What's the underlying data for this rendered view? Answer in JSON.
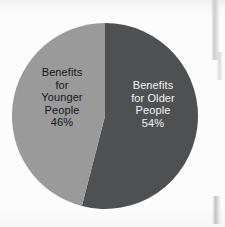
{
  "chart_data": {
    "type": "pie",
    "title": "",
    "subtitle": "",
    "xlabel": "",
    "ylabel": "",
    "legend_position": "none",
    "grid": false,
    "labels_inside_slices": true,
    "start_angle_deg": 0,
    "direction": "clockwise",
    "categories": [
      "Benefits for Older People",
      "Benefits for Younger People"
    ],
    "values": [
      54,
      46
    ],
    "units": "%",
    "slices": [
      {
        "name": "Benefits for Older People",
        "value": 54,
        "value_label": "54%",
        "label_lines": [
          "Benefits",
          "for Older",
          "People",
          "54%"
        ],
        "label_text": "Benefits\nfor Older\nPeople\n54%",
        "color": "#4f5052",
        "text_color": "#f2f3f4"
      },
      {
        "name": "Benefits for Younger People",
        "value": 46,
        "value_label": "46%",
        "label_lines": [
          "Benefits",
          "for",
          "Younger",
          "People",
          "46%"
        ],
        "label_text": "Benefits\nfor\nYounger\nPeople\n46%",
        "color": "#9a9a9a",
        "text_color": "#14161a"
      }
    ]
  },
  "canvas": {
    "background_color": "#fcfcfc",
    "pie_center_x": 105,
    "pie_center_y": 116,
    "pie_radius": 93
  }
}
